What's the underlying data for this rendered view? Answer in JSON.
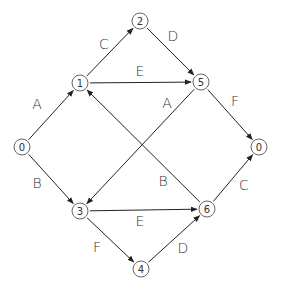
{
  "diagram": {
    "type": "activity-network",
    "nodes": [
      {
        "id": "n0",
        "label": "0",
        "x": 22,
        "y": 147
      },
      {
        "id": "n1",
        "label": "1",
        "x": 80,
        "y": 83
      },
      {
        "id": "n2",
        "label": "2",
        "x": 140,
        "y": 21
      },
      {
        "id": "n5",
        "label": "5",
        "x": 201,
        "y": 82
      },
      {
        "id": "n0b",
        "label": "0",
        "x": 259,
        "y": 147
      },
      {
        "id": "n3",
        "label": "3",
        "x": 80,
        "y": 211
      },
      {
        "id": "n6",
        "label": "6",
        "x": 207,
        "y": 209
      },
      {
        "id": "n4",
        "label": "4",
        "x": 141,
        "y": 269
      }
    ],
    "edges": [
      {
        "from": "n0",
        "to": "n1",
        "label": "A",
        "lx": 37,
        "ly": 104
      },
      {
        "from": "n1",
        "to": "n2",
        "label": "C",
        "lx": 104,
        "ly": 44
      },
      {
        "from": "n2",
        "to": "n5",
        "label": "D",
        "lx": 173,
        "ly": 36
      },
      {
        "from": "n1",
        "to": "n5",
        "label": "E",
        "lx": 140,
        "ly": 71
      },
      {
        "from": "n5",
        "to": "n0b",
        "label": "F",
        "lx": 235,
        "ly": 101
      },
      {
        "from": "n0",
        "to": "n3",
        "label": "B",
        "lx": 37,
        "ly": 183
      },
      {
        "from": "n5",
        "to": "n3",
        "label": "A",
        "lx": 167,
        "ly": 103
      },
      {
        "from": "n6",
        "to": "n1",
        "label": "B",
        "lx": 163,
        "ly": 181
      },
      {
        "from": "n3",
        "to": "n6",
        "label": "E",
        "lx": 140,
        "ly": 221
      },
      {
        "from": "n3",
        "to": "n4",
        "label": "F",
        "lx": 97,
        "ly": 247
      },
      {
        "from": "n4",
        "to": "n6",
        "label": "D",
        "lx": 183,
        "ly": 248
      },
      {
        "from": "n6",
        "to": "n0b",
        "label": "C",
        "lx": 244,
        "ly": 185
      }
    ],
    "colors": {
      "line": "#222222",
      "node_stroke": "#666666",
      "text": "#333333",
      "background": "#ffffff"
    },
    "node_radius": 8
  }
}
